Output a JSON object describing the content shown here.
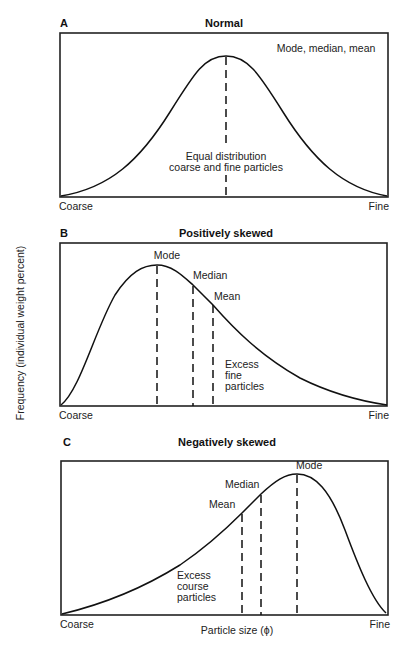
{
  "y_axis_label": "Frequency (individual weight percent)",
  "x_axis_label": "Particle size (ϕ)",
  "panels": [
    {
      "letter": "A",
      "title": "Normal",
      "left_label": "Coarse",
      "right_label": "Fine",
      "annotations": {
        "center": "Mode, median, mean",
        "note_line1": "Equal distribution",
        "note_line2": "coarse and fine particles"
      }
    },
    {
      "letter": "B",
      "title": "Positively skewed",
      "left_label": "Coarse",
      "right_label": "Fine",
      "annotations": {
        "mode": "Mode",
        "median": "Median",
        "mean": "Mean",
        "note_line1": "Excess",
        "note_line2": "fine",
        "note_line3": "particles"
      }
    },
    {
      "letter": "C",
      "title": "Negatively skewed",
      "left_label": "Coarse",
      "right_label": "Fine",
      "annotations": {
        "mode": "Mode",
        "median": "Median",
        "mean": "Mean",
        "note_line1": "Excess",
        "note_line2": "course",
        "note_line3": "particles"
      }
    }
  ]
}
